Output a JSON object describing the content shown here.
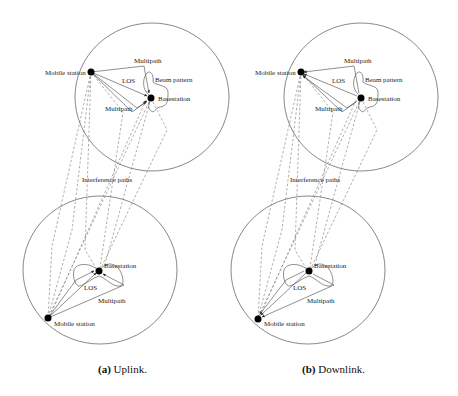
{
  "figure": {
    "panels": [
      {
        "id": "a",
        "caption_tag": "(a)",
        "caption_text": " Uplink.",
        "labels": {
          "mobile_top": "Mobile station",
          "multipath_top_upper": "Multipath",
          "los_top": "LOS",
          "beam_pattern": "Beam pattern",
          "basestation_top": "Basestation",
          "multipath_top_lower": "Multipath",
          "interference": "Interference paths",
          "basestation_bottom": "Basestation",
          "los_bottom": "LOS",
          "multipath_bottom": "Multipath",
          "mobile_bottom": "Mobile station"
        }
      },
      {
        "id": "b",
        "caption_tag": "(b)",
        "caption_text": " Downlink.",
        "labels": {
          "mobile_top": "Mobile station",
          "multipath_top_upper": "Multipath",
          "los_top": "LOS",
          "beam_pattern": "Beam pattern",
          "basestation_top": "Basestation",
          "multipath_top_lower": "Multipath",
          "interference": "Interference paths",
          "basestation_bottom": "Basestation",
          "los_bottom": "LOS",
          "multipath_bottom": "Multipath",
          "mobile_bottom": "Mobile station"
        }
      }
    ],
    "colors": {
      "line": "#555555",
      "dot": "#000000",
      "dashed": "#777777"
    }
  }
}
